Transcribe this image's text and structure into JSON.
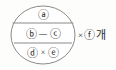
{
  "figure": {
    "name": "circle-partition-expression",
    "background_color": "#fdfdfc",
    "stroke_color": "#8a8a8a",
    "text_color": "#2b2b2b"
  },
  "circle": {
    "center_x": 43,
    "center_y": 35,
    "radius_x": 32,
    "radius_y": 29
  },
  "dividers": [
    {
      "name": "upper-chord",
      "y": 23
    },
    {
      "name": "lower-chord",
      "y": 43
    }
  ],
  "bands": {
    "top": {
      "label": "ⓐ",
      "tokens": [
        {
          "type": "circled",
          "text": "ⓐ"
        }
      ]
    },
    "middle": {
      "label": "ⓑ—ⓒ",
      "tokens": [
        {
          "type": "circled",
          "text": "ⓑ"
        },
        {
          "type": "operator",
          "text": "—"
        },
        {
          "type": "circled",
          "text": "ⓒ"
        }
      ]
    },
    "bottom": {
      "label": "ⓓ×ⓔ",
      "tokens": [
        {
          "type": "circled",
          "text": "ⓓ"
        },
        {
          "type": "operator",
          "text": "×"
        },
        {
          "type": "circled",
          "text": "ⓔ"
        }
      ]
    }
  },
  "multiplier": {
    "operator": "×",
    "value": "ⓕ",
    "unit": "개",
    "full_text": "×ⓕ개"
  }
}
